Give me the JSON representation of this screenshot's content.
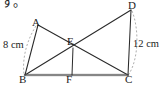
{
  "page": {
    "partial_text_top": "す。"
  },
  "figure": {
    "type": "geometry-diagram",
    "stroke_color": "#2a2a2a",
    "baseline_color": "#9a9a9a",
    "dash_color": "#9e9e9e",
    "vertices": [
      {
        "id": "A",
        "label": "A",
        "x": 38,
        "y": 25
      },
      {
        "id": "D",
        "label": "D",
        "x": 131,
        "y": 9
      },
      {
        "id": "E",
        "label": "E",
        "x": 73,
        "y": 48
      },
      {
        "id": "B",
        "label": "B",
        "x": 25,
        "y": 74
      },
      {
        "id": "F",
        "label": "F",
        "x": 72,
        "y": 74
      },
      {
        "id": "C",
        "label": "C",
        "x": 128,
        "y": 74
      }
    ],
    "segments": [
      {
        "name": "segment-A-B",
        "from": "A",
        "to": "B"
      },
      {
        "name": "segment-A-C",
        "from": "A",
        "to": "C"
      },
      {
        "name": "segment-B-D",
        "from": "B",
        "to": "D"
      },
      {
        "name": "segment-D-C",
        "from": "D",
        "to": "C"
      },
      {
        "name": "segment-B-C",
        "from": "B",
        "to": "C"
      },
      {
        "name": "segment-E-F",
        "from": "E",
        "to": "F"
      }
    ],
    "measurements": [
      {
        "name": "left-measure",
        "value": "8 cm",
        "applies_to": "A-B"
      },
      {
        "name": "right-measure",
        "value": "12 cm",
        "applies_to": "D-C"
      }
    ]
  }
}
